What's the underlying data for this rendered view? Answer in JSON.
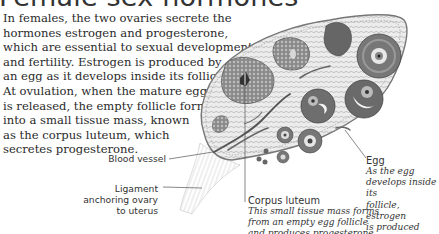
{
  "title": "Female sex hormones",
  "body_lines": [
    "In females, the two ovaries secrete the",
    "hormones estrogen and progesterone,",
    "which are essential to sexual development",
    "and fertility. Estrogen is produced by",
    "an egg as it develops inside its follicle.",
    "At ovulation, when the mature egg",
    "is released, the empty follicle forms",
    "into a small tissue mass, known",
    "as the corpus luteum, which",
    "secretes progesterone."
  ],
  "labels": {
    "blood_vessel": "Blood vessel",
    "ligament": [
      "Ligament",
      "anchoring ovary",
      "to uterus"
    ],
    "corpus_luteum": {
      "title": "Corpus luteum",
      "desc": [
        "This small tissue mass forms",
        "from an empty egg follicle",
        "and produces progesterone"
      ]
    },
    "egg": {
      "title": "Egg",
      "desc": [
        "As the egg",
        "develops inside its",
        "follicle, estrogen",
        "is produced"
      ]
    }
  },
  "colors": {
    "text": "#2a2a2a",
    "ovary_fill": "#e6e6e6",
    "follicle_dark": "#5a5a5a",
    "background": "#ffffff"
  }
}
